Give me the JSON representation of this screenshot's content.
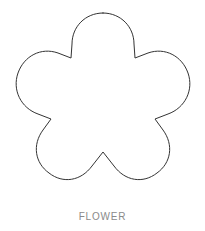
{
  "canvas": {
    "width": 205,
    "height": 231,
    "background_color": "#ffffff"
  },
  "figure": {
    "name": "flower",
    "type": "outline-clipart",
    "stroke_color": "#333333",
    "fill_color": "#ffffff",
    "stroke_width": 1,
    "petal_count": 5,
    "bounds": {
      "x": 12,
      "y": 13,
      "width": 181,
      "height": 179
    },
    "center": {
      "x": 103,
      "y": 103
    },
    "notches": [
      {
        "label": "top-left-notch",
        "x": 72,
        "y": 58
      },
      {
        "label": "top-right-notch",
        "x": 135,
        "y": 58
      },
      {
        "label": "left-notch",
        "x": 47,
        "y": 122
      },
      {
        "label": "right-notch",
        "x": 158,
        "y": 122
      },
      {
        "label": "bottom-center-notch",
        "x": 103,
        "y": 172
      }
    ],
    "path": "M 103 13 C 121 13 134 27 134 44 L 135 58 L 148 53 C 165 47 182 56 188 73 C 194 90 185 108 168 114 L 155 119 L 163 130 C 174 145 171 163 157 173 C 143 184 125 181 114 166 L 103 152 L 92 166 C 81 181 63 184 49 173 C 35 163 32 145 43 130 L 51 119 L 38 114 C 21 108 12 90 18 73 C 24 56 41 47 58 53 L 71 58 L 72 44 C 72 27 85 13 103 13 Z"
  },
  "caption": {
    "text": "FLOWER",
    "color": "#8a8a8a"
  }
}
